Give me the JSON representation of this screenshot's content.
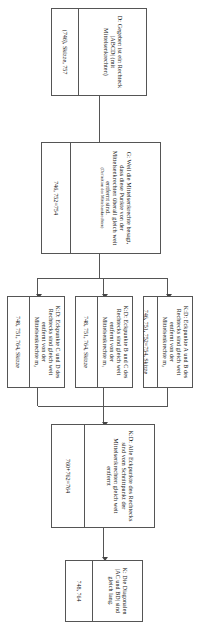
{
  "diagram": {
    "language": "de",
    "orientation": "rotated-90",
    "line_color": "#555555",
    "box_fill": "#ffffff",
    "nodes": [
      {
        "id": "D",
        "text": "D: Gegeben ist ein Rechteck |ABCD| (mit Mittelsenkrechten)",
        "refs": "(746), Skizze, 757"
      },
      {
        "id": "G",
        "text": "G: Weil die Mittelsenkrechte besagt, dass diese Punkte von der Mittelsenkrechten überall gleich weit entfernt sind.",
        "text_note": "(Definition der Mittelsenkrechten)",
        "refs": "746, 752=754"
      },
      {
        "id": "K1",
        "text": "K:D: Eckpunkte A und B des Rechtecks sind gleich weit entfernt von der Mittelsenkrechte m₂",
        "refs": "746, 751, 752=754, Skizze"
      },
      {
        "id": "K2",
        "text": "K:D: Eckpunkte B und C des Rechtecks sind gleich weit entfernt von der Mittelsenkrechte m₁",
        "refs": "748, 751, 764, Skizze"
      },
      {
        "id": "K3",
        "text": "K:D: Eckpunkte C und D des Rechtecks sind gleich weit entfernt von der Mittelsenkrechte m₂",
        "refs": "748, 751, 764, Skizze"
      },
      {
        "id": "KD",
        "text": "K:D: Alle Eckpunkte des Rechtecks sind vom Schnittpunkt der Mittelsenkrechten gleich weit entfernt",
        "refs": "760+762=764"
      },
      {
        "id": "K",
        "text": "K: Die Diagonalen |AC und BD| sind gleich lang.",
        "refs": "748, 764"
      }
    ]
  }
}
